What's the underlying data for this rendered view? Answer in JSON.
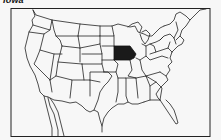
{
  "title": "Iowa",
  "map": {
    "subject": "United States of America",
    "highlighted_state": "Iowa",
    "highlight_color": "#1a1a1a",
    "outline_color": "#222222",
    "background_color": "#f7f7f7"
  }
}
